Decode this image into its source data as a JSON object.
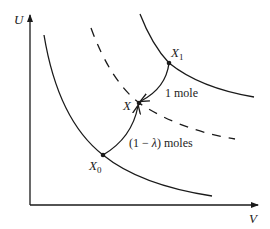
{
  "diagram": {
    "axes": {
      "y_label": "U",
      "x_label": "V"
    },
    "points": {
      "x1": {
        "label": "X",
        "subscript": "1"
      },
      "x": {
        "label": "X"
      },
      "x0": {
        "label": "X",
        "subscript": "0"
      }
    },
    "annotations": {
      "one_mole": "1 mole",
      "lambda_moles_open": "(1 − ",
      "lambda_symbol": "λ",
      "lambda_moles_close": ") moles"
    },
    "curves": [
      {
        "name": "upper-solid-curve",
        "style": "solid",
        "passes_through": "X1"
      },
      {
        "name": "lower-solid-curve",
        "style": "solid",
        "passes_through": "X0"
      },
      {
        "name": "dashed-curve",
        "style": "dashed",
        "passes_through": "X"
      }
    ],
    "colors": {
      "stroke": "#1a1a1a",
      "text": "#222222"
    }
  }
}
